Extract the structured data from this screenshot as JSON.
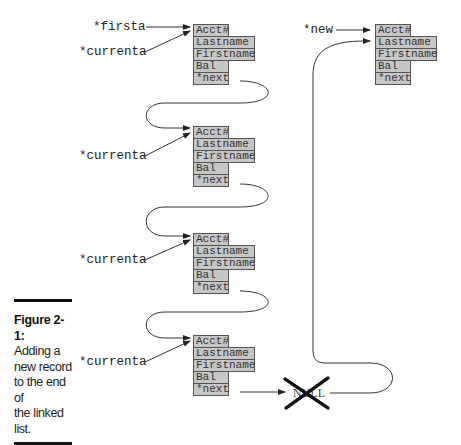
{
  "figure": {
    "pointers": {
      "firsta": "*firsta",
      "currenta": "*currenta",
      "new": "*new"
    },
    "records": [
      {
        "fields": [
          "Acct#",
          "Lastname",
          "Firstname",
          "Bal",
          "*next"
        ]
      },
      {
        "fields": [
          "Acct#",
          "Lastname",
          "Firstname",
          "Bal",
          "*next"
        ]
      },
      {
        "fields": [
          "Acct#",
          "Lastname",
          "Firstname",
          "Bal",
          "*next"
        ]
      },
      {
        "fields": [
          "Acct#",
          "Lastname",
          "Firstname",
          "Bal",
          "*next"
        ]
      }
    ],
    "new_record": {
      "fields": [
        "Acct#",
        "Lastname",
        "Firstname",
        "Bal",
        "*next"
      ]
    },
    "null_label": "NULL"
  },
  "caption": {
    "title": "Figure 2-1:",
    "lines": [
      "Adding a",
      "new record",
      "to the end of",
      "the linked",
      "list."
    ]
  },
  "colors": {
    "field_fill": "#c6c6c6",
    "field_border": "#555555",
    "line": "#333333"
  }
}
